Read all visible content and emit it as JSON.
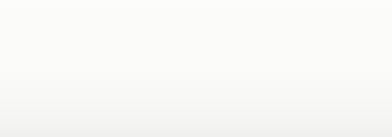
{
  "diagram": {
    "type": "flow-diagram",
    "colors": {
      "top_node_fill": "#c9c9c9",
      "bottom_node_fill": "#a9a9a9",
      "arrow_fill": "#b4b4b4",
      "text": "#303030",
      "background": "#fdfdfd"
    },
    "top_row": [
      {
        "id": "node-g",
        "label": "ㄍ",
        "x": 22,
        "y": 8,
        "w": 62,
        "h": 55
      },
      {
        "id": "node-j",
        "label": "ㄐ",
        "x": 113,
        "y": 8,
        "w": 62,
        "h": 55
      },
      {
        "id": "node-x",
        "label": "ㄒ",
        "x": 205,
        "y": 12,
        "w": 62,
        "h": 50
      },
      {
        "id": "node-zhsh",
        "label": "ㄓ、ㄕ",
        "x": 296,
        "y": 8,
        "w": 68,
        "h": 55
      }
    ],
    "bottom_row": [
      {
        "id": "node-k",
        "label": "ㄎ",
        "x": 24,
        "y": 88,
        "w": 62,
        "h": 44
      },
      {
        "id": "node-q",
        "label": "ㄑ",
        "x": 114,
        "y": 88,
        "w": 64,
        "h": 44
      },
      {
        "id": "node-chr",
        "label": "ㄔ、ㄖ",
        "x": 298,
        "y": 88,
        "w": 68,
        "h": 44
      }
    ],
    "arrows": [
      {
        "id": "arrow-g-to-j",
        "kind": "right",
        "from": "node-g",
        "to": "node-j",
        "x": 84,
        "y": 26,
        "w": 30,
        "h": 20
      },
      {
        "id": "arrow-j-to-x",
        "kind": "right",
        "from": "node-j",
        "to": "node-x",
        "x": 175,
        "y": 26,
        "w": 30,
        "h": 20
      },
      {
        "id": "arrow-x-to-zhsh",
        "kind": "right",
        "from": "node-x",
        "to": "node-zhsh",
        "x": 267,
        "y": 26,
        "w": 30,
        "h": 20
      },
      {
        "id": "arrow-g-to-k",
        "kind": "down",
        "from": "node-g",
        "to": "node-k",
        "x": 40,
        "y": 55,
        "w": 26,
        "h": 38
      },
      {
        "id": "arrow-j-to-q",
        "kind": "down",
        "from": "node-j",
        "to": "node-q",
        "x": 131,
        "y": 55,
        "w": 26,
        "h": 38
      },
      {
        "id": "arrow-zhsh-to-chr",
        "kind": "down",
        "from": "node-zhsh",
        "to": "node-chr",
        "x": 316,
        "y": 55,
        "w": 26,
        "h": 38
      },
      {
        "id": "arrow-k-to-j",
        "kind": "diagonal",
        "from": "node-k",
        "to": "node-j",
        "x": 78,
        "y": 52,
        "w": 40,
        "h": 44
      },
      {
        "id": "arrow-q-to-zhsh",
        "kind": "diagonal",
        "from": "node-q",
        "to": "node-x",
        "x": 168,
        "y": 52,
        "w": 42,
        "h": 44
      }
    ]
  }
}
